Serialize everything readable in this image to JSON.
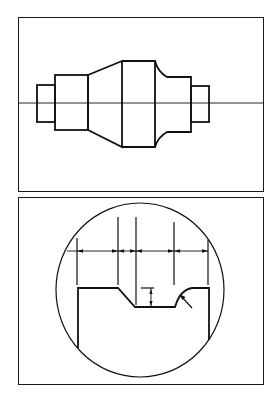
{
  "figure": {
    "panels": [
      {
        "id": "top",
        "name": "shaft-profile-view",
        "content": "Stepped shaft silhouette with centerline; sections from left: small end step, shoulder, conical taper, largest cylinder, radiused shoulder, mid step, small end step",
        "bounds": {
          "x": 18,
          "y": 17,
          "width": 245,
          "height": 174
        }
      },
      {
        "id": "bottom",
        "name": "groove-detail-view",
        "content": "Circular magnified detail showing shoulder, chamfered entry, groove floor, radius fillet; horizontal chain dimension line with arrows, depth dimension, radius leader arrow",
        "bounds": {
          "x": 18,
          "y": 197,
          "width": 245,
          "height": 187
        }
      }
    ],
    "colors": {
      "line": "#111111",
      "background": "#ffffff",
      "frame": "#1a1a1a"
    }
  }
}
